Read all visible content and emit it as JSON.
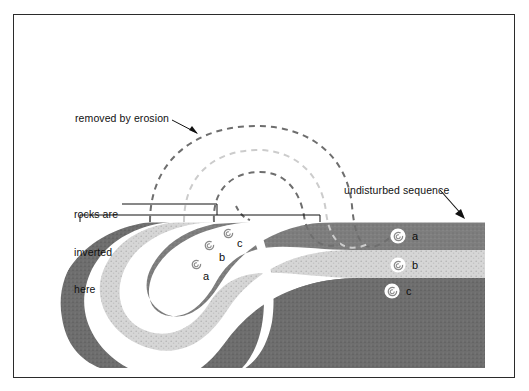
{
  "figure": {
    "frame": {
      "x": 13,
      "y": 14,
      "w": 502,
      "h": 364,
      "border_color": "#2b2b2b"
    }
  },
  "labels": {
    "removed_by_erosion": "removed by erosion",
    "rocks_are_inverted_here": "rocks are\ninverted\nhere",
    "rocks_inverted_line1": "rocks are",
    "rocks_inverted_line2": "inverted",
    "rocks_inverted_line3": "here",
    "undisturbed_sequence": "undisturbed sequence"
  },
  "layers": [
    {
      "id": "a",
      "name": "upper bed",
      "color": "#7e7e7e",
      "texture": "fine-stipple-dark"
    },
    {
      "id": "b",
      "name": "middle bed",
      "color": "#d2d2d2",
      "texture": "coarse-stipple-light"
    },
    {
      "id": "c",
      "name": "lower bed",
      "color": "#6e6e6e",
      "texture": "fine-stipple-dark"
    }
  ],
  "fossils": {
    "icon": "ammonite-spiral-icon",
    "undisturbed_side": [
      {
        "letter": "a",
        "layer": "a",
        "x": 398,
        "y": 236
      },
      {
        "letter": "b",
        "layer": "b",
        "x": 398,
        "y": 265
      },
      {
        "letter": "c",
        "layer": "c",
        "x": 392,
        "y": 291
      }
    ],
    "inverted_side": [
      {
        "letter": "a",
        "layer": "a",
        "x": 196,
        "y": 264
      },
      {
        "letter": "b",
        "layer": "b",
        "x": 209,
        "y": 245
      },
      {
        "letter": "c",
        "layer": "c",
        "x": 228,
        "y": 233
      }
    ]
  },
  "erosion_arcs": [
    {
      "for_layer": "a",
      "color": "#6e6e6e",
      "dash": "6 5"
    },
    {
      "for_layer": "b",
      "color": "#cccccc",
      "dash": "6 5"
    },
    {
      "for_layer": "c",
      "color": "#6e6e6e",
      "dash": "6 5"
    }
  ],
  "annotations": {
    "erosion_arrow": "arrow-pointing-to-dashed-arc",
    "undisturbed_arrow": "arrow-pointing-to-horizontal-strata",
    "inverted_bracket": "bracket-spanning-inverted-limb"
  },
  "colors": {
    "background": "#ffffff",
    "ink": "#111111",
    "dark_bed": "#7e7e7e",
    "light_bed": "#d2d2d2",
    "bottom_bed": "#6e6e6e",
    "dash_dark": "#6e6e6e",
    "dash_light": "#cccccc"
  }
}
